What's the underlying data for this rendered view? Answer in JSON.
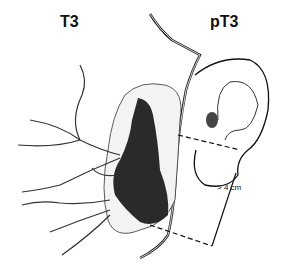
{
  "diagram": {
    "labels": {
      "left": "T3",
      "right": "pT3",
      "measurement": "> 4 cm"
    },
    "elements": [
      "parotid-gland",
      "tumor-mass",
      "facial-nerve-branches",
      "ear",
      "external-carotid-artery",
      "measurement-bracket"
    ],
    "colors": {
      "ink": "#111111",
      "background": "#ffffff"
    }
  }
}
